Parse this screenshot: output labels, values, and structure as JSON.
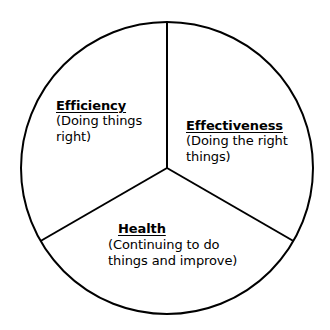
{
  "diagram": {
    "type": "three-sector-circle",
    "shape": "circle",
    "stroke_color": "#000000",
    "fill_color": "#ffffff",
    "background_color": "#ffffff",
    "text_color": "#000000",
    "center": {
      "x": 167,
      "y": 168
    },
    "radius": 146,
    "stroke_width": 2,
    "divider_angles_deg": [
      90,
      210,
      330
    ],
    "sectors": [
      {
        "id": "efficiency",
        "heading": "Efficiency",
        "description": "(Doing things right)",
        "position": "upper-left",
        "angle_range_deg": [
          90,
          210
        ]
      },
      {
        "id": "effectiveness",
        "heading": "Effectiveness",
        "description": "(Doing the right things)",
        "position": "right",
        "angle_range_deg": [
          330,
          90
        ]
      },
      {
        "id": "health",
        "heading": "Health",
        "description": "(Continuing to do things and improve)",
        "position": "bottom",
        "angle_range_deg": [
          210,
          330
        ]
      }
    ]
  }
}
